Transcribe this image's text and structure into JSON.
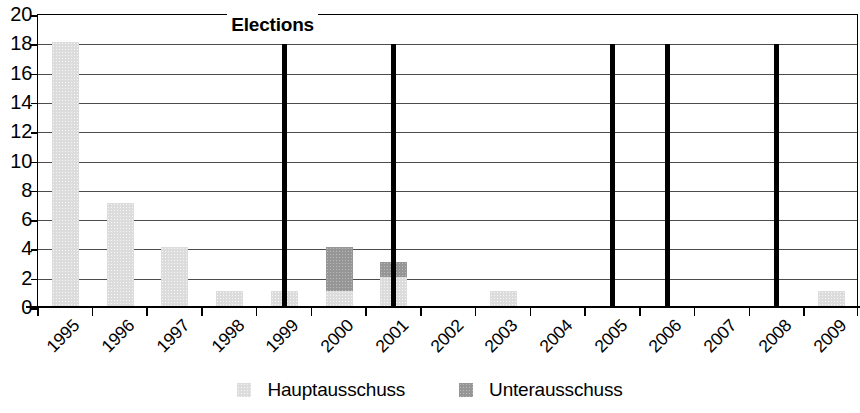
{
  "chart_data": {
    "type": "bar",
    "stacked": true,
    "title": "",
    "xlabel": "",
    "ylabel": "",
    "ylim": [
      0,
      20
    ],
    "ytick_step": 2,
    "yticks": [
      0,
      2,
      4,
      6,
      8,
      10,
      12,
      14,
      16,
      18,
      20
    ],
    "grid": true,
    "grid_axis": "y",
    "legend_position": "bottom-center",
    "categories": [
      "1995",
      "1996",
      "1997",
      "1998",
      "1999",
      "2000",
      "2001",
      "2002",
      "2003",
      "2004",
      "2005",
      "2006",
      "2007",
      "2008",
      "2009"
    ],
    "series": [
      {
        "name": "Hauptausschuss",
        "color": "#dcdcdc",
        "values": [
          18,
          7,
          4,
          1,
          1,
          1,
          2,
          0,
          1,
          0,
          0,
          0,
          0,
          0,
          1
        ]
      },
      {
        "name": "Unterausschuss",
        "color": "#969696",
        "values": [
          0,
          0,
          0,
          0,
          0,
          3,
          1,
          0,
          0,
          0,
          0,
          0,
          0,
          0,
          0
        ]
      }
    ],
    "totals": [
      18,
      7,
      4,
      1,
      1,
      4,
      3,
      0,
      1,
      0,
      0,
      0,
      0,
      0,
      1
    ],
    "annotations": [
      {
        "label": "Elections",
        "type": "vertical-lines",
        "color": "#000000",
        "line_top_value": 18,
        "at_categories": [
          "1999",
          "2001",
          "2005",
          "2006",
          "2008"
        ]
      }
    ]
  },
  "axes": {
    "y_tick_labels": [
      "20",
      "18",
      "16",
      "14",
      "12",
      "10",
      "8",
      "6",
      "4",
      "2",
      "0"
    ],
    "x_tick_labels": [
      "1995",
      "1996",
      "1997",
      "1998",
      "1999",
      "2000",
      "2001",
      "2002",
      "2003",
      "2004",
      "2005",
      "2006",
      "2007",
      "2008",
      "2009"
    ]
  },
  "annotation": {
    "elections_label": "Elections"
  },
  "legend": {
    "items": [
      {
        "label": "Hauptausschuss",
        "color": "#dcdcdc",
        "swatch": "legend-swatch-main"
      },
      {
        "label": "Unterausschuss",
        "color": "#969696",
        "swatch": "legend-swatch-sub"
      }
    ]
  }
}
